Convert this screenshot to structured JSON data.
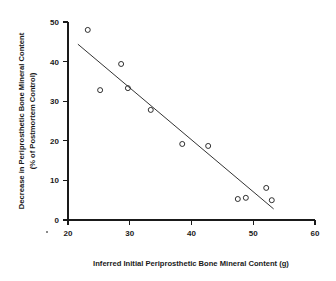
{
  "chart_data": {
    "type": "scatter",
    "title": "",
    "subtitle": "",
    "xlabel": "Inferred Initial Periprosthetic Bone Mineral Content (g)",
    "ylabel_line1": "Decrease in Periprosthetic Bone Mineral Content",
    "ylabel_line2": "(% of Postmortem Control)",
    "xlim": [
      20,
      60
    ],
    "ylim": [
      0,
      50
    ],
    "xticks": [
      20,
      30,
      40,
      50,
      60
    ],
    "xtick_labels": [
      "20",
      "30",
      "40",
      "50",
      "60"
    ],
    "yticks": [
      0,
      10,
      20,
      30,
      40,
      50
    ],
    "ytick_labels": [
      "0",
      "10",
      "20",
      "30",
      "40",
      "50"
    ],
    "grid": false,
    "legend": false,
    "legend_position": "none",
    "marker": "open-circle",
    "marker_color": "#1a1a1a",
    "series": [
      {
        "name": "Specimens",
        "x": [
          23.2,
          25.2,
          28.6,
          29.7,
          33.4,
          38.5,
          42.7,
          47.5,
          48.8,
          52.1,
          53.0
        ],
        "y": [
          48.0,
          32.8,
          39.4,
          33.3,
          27.8,
          19.2,
          18.7,
          5.3,
          5.6,
          8.1,
          5.0
        ]
      }
    ],
    "fit_line": {
      "name": "Linear regression",
      "x": [
        21.6,
        53.3
      ],
      "y": [
        44.4,
        2.8
      ],
      "color": "#333333"
    },
    "annotations": []
  },
  "axes": {
    "x_title": "Inferred Initial Periprosthetic Bone Mineral Content (g)",
    "y_title_line1": "Decrease in Periprosthetic Bone Mineral Content",
    "y_title_line2": "(% of Postmortem Control)"
  }
}
